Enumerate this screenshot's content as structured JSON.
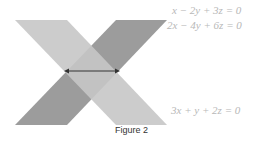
{
  "figure": {
    "caption": "Figure 2",
    "equations": [
      {
        "text": "x − 2y + 3z = 0"
      },
      {
        "text": "2x − 4y + 6z = 0"
      },
      {
        "text": "3x + y + 2z = 0"
      }
    ],
    "colors": {
      "light_plane": "#c4c4c4",
      "dark_plane": "#9a9a9a",
      "overlap": "#b0b0b0",
      "arrow": "#333333"
    }
  }
}
